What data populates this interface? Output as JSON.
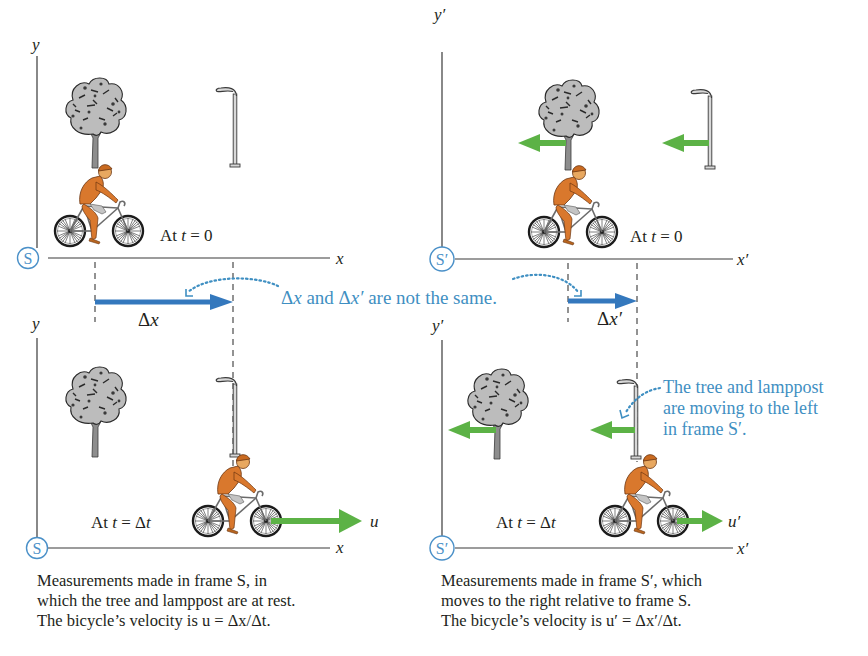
{
  "figure": {
    "colors": {
      "axis": "#3a3a3a",
      "frame_circle": "#4a90c8",
      "displacement_arrow": "#3478bd",
      "velocity_arrow": "#5cb246",
      "annotation_text": "#3f8fc2",
      "rider": "#d9782d",
      "tree": "#b9b9b9"
    },
    "panels": [
      {
        "id": "S-t0",
        "frame_label": "S",
        "x_axis_label": "x",
        "y_axis_label": "y",
        "time_label": "At t = 0",
        "time_label_parts": {
          "prefix": "At ",
          "var": "t",
          "eq": " = 0"
        }
      },
      {
        "id": "Sprime-t0",
        "frame_label": "S′",
        "x_axis_label": "x′",
        "y_axis_label": "y′",
        "time_label": "At t = 0",
        "time_label_parts": {
          "prefix": "At ",
          "var": "t",
          "eq": " = 0"
        }
      },
      {
        "id": "S-tdt",
        "frame_label": "S",
        "x_axis_label": "x",
        "y_axis_label": "y",
        "time_label": "At t = Δt",
        "time_label_parts": {
          "prefix": "At ",
          "var": "t",
          "eq": " = Δ",
          "var2": "t"
        },
        "velocity_label": "u"
      },
      {
        "id": "Sprime-tdt",
        "frame_label": "S′",
        "x_axis_label": "x′",
        "y_axis_label": "y′",
        "time_label": "At t = Δt",
        "time_label_parts": {
          "prefix": "At ",
          "var": "t",
          "eq": " = Δ",
          "var2": "t"
        },
        "velocity_label": "u′"
      }
    ],
    "displacements": {
      "left": {
        "delta": "Δ",
        "var": "x",
        "label": "Δx"
      },
      "right": {
        "delta": "Δ",
        "var": "x′",
        "label": "Δx′"
      }
    },
    "annotations": {
      "not_same": {
        "text": "Δx and Δx′ are not the same.",
        "parts": {
          "d1": "Δ",
          "v1": "x",
          "mid": " and ",
          "d2": "Δ",
          "v2": "x′",
          "end": " are not the same."
        }
      },
      "moving_left": {
        "lines": [
          "The tree and lamppost",
          "are moving to the left",
          "in frame S′."
        ]
      }
    },
    "captions": {
      "left": {
        "lines": [
          "Measurements made in frame S, in",
          "which the tree and lamppost are at rest.",
          "The bicycle’s velocity is u = Δx/Δt."
        ]
      },
      "right": {
        "lines": [
          "Measurements made in frame S′, which",
          "moves to the right relative to frame S.",
          "The bicycle’s velocity is u′ = Δx′/Δt."
        ]
      }
    }
  }
}
